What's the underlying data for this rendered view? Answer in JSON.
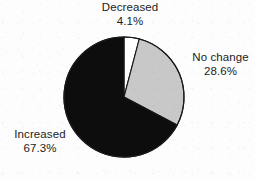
{
  "chart_data": {
    "type": "pie",
    "title": "",
    "subtitle": "",
    "xlabel": "",
    "ylabel": "",
    "grid": false,
    "legend_position": "none",
    "label_style": "outside-callout",
    "start_angle_deg": 0,
    "direction": "clockwise",
    "categories": [
      "Decreased",
      "No change",
      "Increased"
    ],
    "values": [
      4.1,
      28.6,
      67.3
    ],
    "value_suffix": "%",
    "colors": [
      "#ffffff",
      "#c8c8c8",
      "#0d0d0d"
    ],
    "slices": [
      {
        "label": "Decreased",
        "value": 4.1,
        "value_text": "4.1%",
        "color": "#ffffff",
        "start_deg": 0.0,
        "sweep_deg": 14.76,
        "end_deg": 14.76
      },
      {
        "label": "No change",
        "value": 28.6,
        "value_text": "28.6%",
        "color": "#c8c8c8",
        "start_deg": 14.76,
        "sweep_deg": 102.96,
        "end_deg": 117.72
      },
      {
        "label": "Increased",
        "value": 67.3,
        "value_text": "67.3%",
        "color": "#0d0d0d",
        "start_deg": 117.72,
        "sweep_deg": 242.28,
        "end_deg": 360.0
      }
    ]
  },
  "labels": {
    "decreased": {
      "name": "Decreased",
      "percent": "4.1%"
    },
    "nochange": {
      "name": "No change",
      "percent": "28.6%"
    },
    "increased": {
      "name": "Increased",
      "percent": "67.3%"
    }
  },
  "style": {
    "outline_color": "#1a1a1a",
    "background": "#fdfdfd",
    "text_color": "#1c1c1c"
  }
}
